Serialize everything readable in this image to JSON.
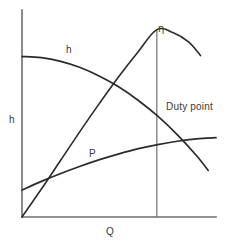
{
  "figure": {
    "title": "",
    "background_color": "#ffffff",
    "curve_color": "#2b2b2b",
    "axis_color": "#6e6e6e",
    "duty_line_color": "#7a7a7a"
  },
  "labels": {
    "y_axis": "h",
    "x_axis": "Q",
    "head_curve": "h",
    "power_curve": "P",
    "efficiency_curve": "η",
    "duty_point": "Duty point"
  },
  "chart_data": {
    "type": "line",
    "title": "",
    "subtitle": "",
    "xlabel": "Q",
    "ylabel": "h",
    "grid": false,
    "legend": "inline-curve-labels",
    "axes": {
      "x_axis_shown": true,
      "y_axis_shown": true,
      "ticks": false,
      "tick_labels": false,
      "xlim": [
        0,
        1
      ],
      "ylim": [
        0,
        1
      ]
    },
    "annotations": [
      {
        "text": "Duty point",
        "x": 0.73,
        "y": 0.55,
        "describes": "vertical line at peak efficiency flow rate"
      },
      {
        "text": "η",
        "x": 0.705,
        "y": 0.93,
        "describes": "efficiency curve label at its maximum"
      },
      {
        "text": "h",
        "x": 0.24,
        "y": 0.81,
        "describes": "head curve label"
      },
      {
        "text": "P",
        "x": 0.36,
        "y": 0.35,
        "describes": "power curve label"
      }
    ],
    "markers": [
      {
        "name": "duty-point-line",
        "type": "vertical-line",
        "x": 0.695,
        "y_from": 0.0,
        "y_to": 0.905
      }
    ],
    "series": [
      {
        "name": "h",
        "label": "Head",
        "description": "Head falls slowly then steeply with increasing flow",
        "x": [
          0.0,
          0.1,
          0.2,
          0.3,
          0.4,
          0.5,
          0.6,
          0.7,
          0.8,
          0.9,
          0.96
        ],
        "y": [
          0.775,
          0.77,
          0.752,
          0.722,
          0.68,
          0.628,
          0.563,
          0.487,
          0.398,
          0.296,
          0.225
        ]
      },
      {
        "name": "eta",
        "label": "Efficiency",
        "description": "Efficiency rises from origin to a maximum at the duty point then falls",
        "x": [
          0.0,
          0.1,
          0.2,
          0.3,
          0.4,
          0.5,
          0.6,
          0.695,
          0.78,
          0.86,
          0.92
        ],
        "y": [
          0.0,
          0.135,
          0.275,
          0.415,
          0.55,
          0.68,
          0.8,
          0.905,
          0.89,
          0.845,
          0.78
        ]
      },
      {
        "name": "P",
        "label": "Power",
        "description": "Power rises steadily and flattens at high flow",
        "x": [
          0.0,
          0.1,
          0.2,
          0.3,
          0.4,
          0.5,
          0.6,
          0.7,
          0.8,
          0.9,
          1.0
        ],
        "y": [
          0.13,
          0.172,
          0.21,
          0.245,
          0.277,
          0.305,
          0.33,
          0.35,
          0.366,
          0.377,
          0.383
        ]
      }
    ]
  }
}
